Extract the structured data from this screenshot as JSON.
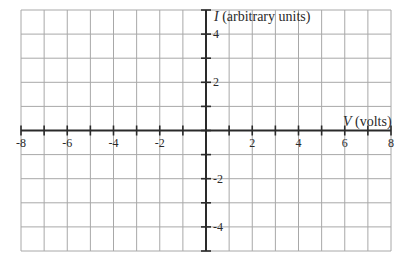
{
  "chart_data": {
    "type": "line",
    "title": "",
    "xlabel": {
      "var": "V",
      "unit": " (volts)"
    },
    "ylabel": {
      "var": "I",
      "unit": " (arbitrary units)"
    },
    "xlim": [
      -8,
      8
    ],
    "ylim": [
      -5,
      5
    ],
    "x_ticks": [
      -8,
      -7,
      -6,
      -5,
      -4,
      -3,
      -2,
      -1,
      0,
      1,
      2,
      3,
      4,
      5,
      6,
      7,
      8
    ],
    "x_tick_labels": [
      "-8",
      "-6",
      "-4",
      "-2",
      "2",
      "4",
      "6",
      "8"
    ],
    "x_tick_label_values": [
      -8,
      -6,
      -4,
      -2,
      2,
      4,
      6,
      8
    ],
    "y_ticks": [
      -5,
      -4,
      -3,
      -2,
      -1,
      0,
      1,
      2,
      3,
      4,
      5
    ],
    "y_tick_labels": [
      "4",
      "2",
      "-2",
      "-4"
    ],
    "y_tick_label_values": [
      4,
      2,
      -2,
      -4
    ],
    "grid": true,
    "grid_step": {
      "x": 1,
      "y": 1
    },
    "series": [],
    "legend": null
  },
  "colors": {
    "grid": "#a8a8a8",
    "axis": "#2a2a2a",
    "text": "#2a2a2a",
    "background": "#ffffff"
  },
  "layout": {
    "plot_left": 21,
    "plot_right": 391,
    "plot_top": 10,
    "plot_bottom": 251
  }
}
